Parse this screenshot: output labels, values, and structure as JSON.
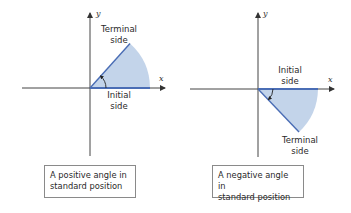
{
  "colors": {
    "wedge_fill": "#c3d4ea",
    "side_line": "#4a6db5",
    "axis": "#444444",
    "box_border": "#8a8a8a"
  },
  "diagrams": [
    {
      "id": "positive",
      "axis_x_label": "x",
      "axis_y_label": "y",
      "terminal_label_line1": "Terminal",
      "terminal_label_line2": "side",
      "initial_label_line1": "Initial",
      "initial_label_line2": "side",
      "caption_line1": "A positive angle in",
      "caption_line2": "standard position",
      "angle_direction": "counterclockwise"
    },
    {
      "id": "negative",
      "axis_x_label": "x",
      "axis_y_label": "y",
      "initial_label_line1": "Initial",
      "initial_label_line2": "side",
      "terminal_label_line1": "Terminal",
      "terminal_label_line2": "side",
      "caption_line1": "A negative angle in",
      "caption_line2": "standard position",
      "angle_direction": "clockwise"
    }
  ]
}
